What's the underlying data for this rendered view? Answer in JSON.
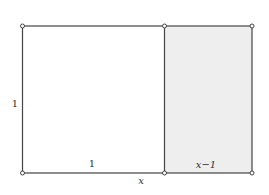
{
  "diagram": {
    "colors": {
      "stroke": "#444444",
      "shaded_fill": "#eeeeee",
      "background": "#ffffff",
      "vertex_fill": "#ffffff"
    },
    "geometry": {
      "left": 22.5,
      "mid": 164.5,
      "right": 252,
      "top": 26,
      "bottom": 173
    },
    "vertices": [
      {
        "x": 22.5,
        "y": 26
      },
      {
        "x": 164.5,
        "y": 26
      },
      {
        "x": 252,
        "y": 26
      },
      {
        "x": 22.5,
        "y": 173
      },
      {
        "x": 164.5,
        "y": 173
      },
      {
        "x": 252,
        "y": 173
      }
    ],
    "labels": {
      "left_side": "1",
      "square_bottom": "1",
      "total_width": "x",
      "shaded_width": "x−1"
    }
  }
}
